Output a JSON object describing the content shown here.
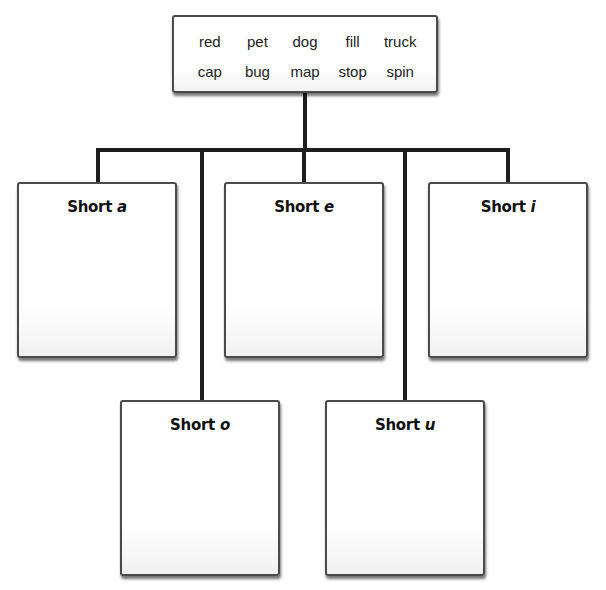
{
  "word_bank": {
    "row1": [
      "red",
      "pet",
      "dog",
      "fill",
      "truck"
    ],
    "row2": [
      "cap",
      "bug",
      "map",
      "stop",
      "spin"
    ]
  },
  "categories": [
    {
      "label": "Short",
      "vowel": "a"
    },
    {
      "label": "Short",
      "vowel": "e"
    },
    {
      "label": "Short",
      "vowel": "i"
    },
    {
      "label": "Short",
      "vowel": "o"
    },
    {
      "label": "Short",
      "vowel": "u"
    }
  ],
  "colors": {
    "line": "#1e1e1e",
    "box_border": "#4a4a4a",
    "background": "#ffffff"
  }
}
